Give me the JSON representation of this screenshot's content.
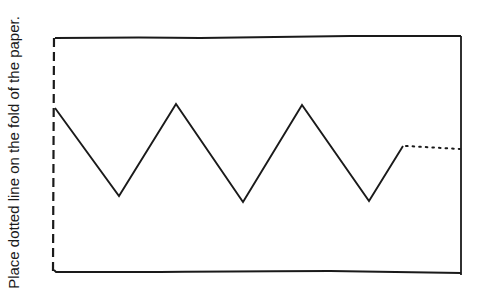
{
  "instruction": "Place dotted line on the fold of the paper.",
  "colors": {
    "background": "#ffffff",
    "ink": "#1a1a1a"
  },
  "frame": {
    "top_left": [
      55,
      38
    ],
    "top_right": [
      461,
      36
    ],
    "bottom_right": [
      461,
      275
    ],
    "bottom_left": [
      55,
      271
    ],
    "left_edge_style": "dashed (fold line)"
  },
  "zigzag": {
    "points": [
      [
        55,
        108
      ],
      [
        119,
        196
      ],
      [
        176,
        104
      ],
      [
        243,
        202
      ],
      [
        302,
        105
      ],
      [
        369,
        201
      ],
      [
        403,
        146
      ]
    ],
    "dotted_extension": [
      [
        403,
        146
      ],
      [
        460,
        149
      ]
    ]
  }
}
